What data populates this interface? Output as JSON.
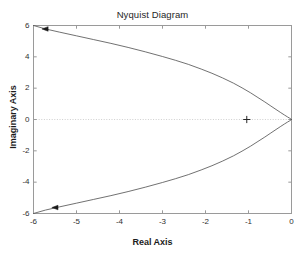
{
  "figure": {
    "width": 305,
    "height": 257,
    "background": "#ffffff",
    "watermark_top": "",
    "watermark_bottom": ""
  },
  "chart_data": {
    "type": "line",
    "title": "Nyquist Diagram",
    "xlabel": "Real Axis",
    "ylabel": "Imaginary Axis",
    "xlim": [
      -6,
      0
    ],
    "ylim": [
      -6,
      6
    ],
    "xticks": [
      -6,
      -5,
      -4,
      -3,
      -2,
      -1,
      0
    ],
    "xticklabels": [
      "-6",
      "-5",
      "-4",
      "-3",
      "-2",
      "-1",
      "0"
    ],
    "yticks": [
      -6,
      -4,
      -2,
      0,
      2,
      4,
      6
    ],
    "yticklabels": [
      "-6",
      "-4",
      "-2",
      "0",
      "2",
      "4",
      "6"
    ],
    "grid": false,
    "legend": null,
    "line_color": "#4d4d4d",
    "line_width": 0.8,
    "zero_line": {
      "y": 0,
      "style": "dotted",
      "color": "#cfcfcf"
    },
    "markers": [
      {
        "name": "critical-point",
        "symbol": "+",
        "x": -1.04,
        "y": 0.0,
        "color": "#262626"
      },
      {
        "name": "direction-arrow-upper",
        "symbol": "triangle-left",
        "x": -5.72,
        "y": 5.78,
        "color": "#1a1a1a"
      },
      {
        "name": "direction-arrow-lower",
        "symbol": "triangle-left",
        "x": -5.49,
        "y": -5.62,
        "color": "#1a1a1a"
      }
    ],
    "series": [
      {
        "name": "nyquist-upper-branch",
        "points": [
          [
            -6.0,
            6.0
          ],
          [
            -5.72,
            5.78
          ],
          [
            -5.4,
            5.58
          ],
          [
            -5.0,
            5.34
          ],
          [
            -4.6,
            5.1
          ],
          [
            -4.2,
            4.86
          ],
          [
            -3.8,
            4.6
          ],
          [
            -3.4,
            4.32
          ],
          [
            -3.0,
            4.02
          ],
          [
            -2.7,
            3.78
          ],
          [
            -2.4,
            3.52
          ],
          [
            -2.1,
            3.22
          ],
          [
            -1.85,
            2.95
          ],
          [
            -1.6,
            2.65
          ],
          [
            -1.35,
            2.32
          ],
          [
            -1.15,
            2.02
          ],
          [
            -0.95,
            1.7
          ],
          [
            -0.78,
            1.4
          ],
          [
            -0.62,
            1.12
          ],
          [
            -0.48,
            0.86
          ],
          [
            -0.36,
            0.64
          ],
          [
            -0.25,
            0.44
          ],
          [
            -0.16,
            0.28
          ],
          [
            -0.09,
            0.16
          ],
          [
            -0.04,
            0.08
          ],
          [
            -0.01,
            0.02
          ],
          [
            0.0,
            0.0
          ]
        ]
      },
      {
        "name": "nyquist-lower-branch",
        "points": [
          [
            0.0,
            0.0
          ],
          [
            -0.01,
            -0.02
          ],
          [
            -0.04,
            -0.08
          ],
          [
            -0.09,
            -0.16
          ],
          [
            -0.16,
            -0.28
          ],
          [
            -0.25,
            -0.44
          ],
          [
            -0.36,
            -0.64
          ],
          [
            -0.48,
            -0.86
          ],
          [
            -0.62,
            -1.12
          ],
          [
            -0.78,
            -1.4
          ],
          [
            -0.95,
            -1.7
          ],
          [
            -1.15,
            -2.02
          ],
          [
            -1.35,
            -2.32
          ],
          [
            -1.6,
            -2.65
          ],
          [
            -1.85,
            -2.95
          ],
          [
            -2.1,
            -3.22
          ],
          [
            -2.4,
            -3.52
          ],
          [
            -2.7,
            -3.78
          ],
          [
            -3.0,
            -4.02
          ],
          [
            -3.4,
            -4.32
          ],
          [
            -3.8,
            -4.6
          ],
          [
            -4.2,
            -4.86
          ],
          [
            -4.6,
            -5.1
          ],
          [
            -5.0,
            -5.34
          ],
          [
            -5.4,
            -5.58
          ],
          [
            -5.72,
            -5.78
          ],
          [
            -6.0,
            -6.0
          ]
        ]
      }
    ]
  }
}
